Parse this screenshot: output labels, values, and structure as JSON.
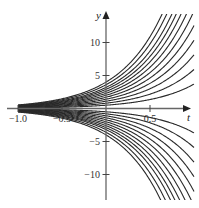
{
  "chart_data": {
    "type": "line",
    "title": "",
    "xlabel": "t",
    "ylabel": "y",
    "xlim": [
      -1.1,
      1.0
    ],
    "ylim": [
      -14,
      15
    ],
    "grid": false,
    "legend": null,
    "x_ticks": [
      -1.0,
      -0.5,
      0.5
    ],
    "x_tick_labels": [
      "−1.0",
      "−0.5",
      "0.5"
    ],
    "y_ticks": [
      10,
      5,
      -5,
      -10
    ],
    "y_tick_labels": [
      "10",
      "5",
      "−5",
      "−10"
    ],
    "rate": 2,
    "constants": [
      0.5,
      0.8,
      1.1,
      1.4,
      1.7,
      2.0,
      2.3,
      2.6,
      2.9,
      3.2,
      3.6,
      4.0,
      -0.5,
      -0.8,
      -1.1,
      -1.4,
      -1.7,
      -2.0,
      -2.3,
      -2.6,
      -2.9,
      -3.2,
      -3.6,
      -4.0
    ],
    "t_start": -1.0,
    "t_end": 1.0,
    "pixel_map": {
      "x0": 106,
      "x_per_unit": 88,
      "y0": 108.5,
      "y_per_unit": 6.6,
      "clip_top": 14,
      "clip_bottom": 200
    }
  },
  "axes": {
    "t_label": "t",
    "y_label": "y"
  }
}
